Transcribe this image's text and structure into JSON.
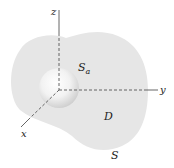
{
  "diagram": {
    "type": "3d-region-with-spherical-cavity",
    "axes": {
      "x_label": "x",
      "y_label": "y",
      "z_label": "z"
    },
    "labels": {
      "inner_surface": "S",
      "inner_surface_sub": "a",
      "region": "D",
      "outer_surface": "S"
    },
    "colors": {
      "region_fill": "#e6e6e6",
      "sphere_highlight": "#ffffff",
      "sphere_shadow": "#cfcfcf",
      "axis": "#555555",
      "text": "#222222"
    }
  }
}
